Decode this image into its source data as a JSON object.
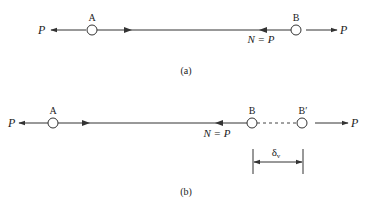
{
  "diagram_a": {
    "caption": "(a)",
    "node_left": "A",
    "node_right": "B",
    "force_left": "P",
    "force_right": "P",
    "internal_force": "N = P"
  },
  "diagram_b": {
    "caption": "(b)",
    "node_left": "A",
    "node_right": "B",
    "node_displaced": "B′",
    "force_left": "P",
    "force_right": "P",
    "internal_force": "N = P",
    "displacement_symbol": "δ",
    "displacement_subscript": "v"
  },
  "colors": {
    "stroke": "#333333",
    "text": "#222222"
  }
}
